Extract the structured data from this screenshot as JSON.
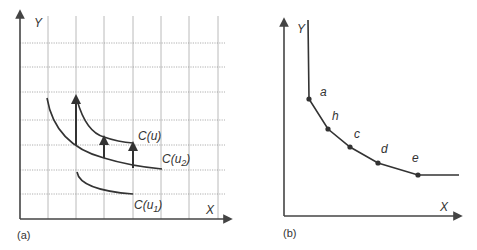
{
  "panel_a": {
    "caption": "(a)",
    "x_axis_label": "X",
    "y_axis_label": "Y",
    "curves": [
      {
        "label": "C(u",
        "sub": "",
        "full": "C(u)"
      },
      {
        "label": "C(u",
        "sub": "2",
        "full": "C(u2)"
      },
      {
        "label": "C(u",
        "sub": "1",
        "full": "C(u1)"
      }
    ],
    "grid": "dotted horizontal, solid vertical",
    "arrows_count": 3
  },
  "panel_b": {
    "caption": "(b)",
    "x_axis_label": "X",
    "y_axis_label": "Y",
    "points": [
      {
        "label": "a"
      },
      {
        "label": "h"
      },
      {
        "label": "c"
      },
      {
        "label": "d"
      },
      {
        "label": "e"
      }
    ]
  },
  "colors": {
    "line": "#333333",
    "grid": "#9a9a9a",
    "background": "#ffffff"
  }
}
